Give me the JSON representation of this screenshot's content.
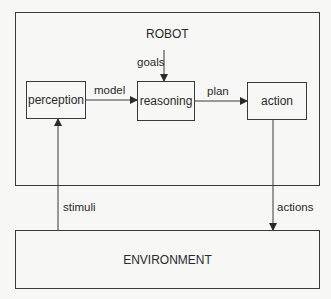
{
  "diagram": {
    "robot": {
      "label": "ROBOT"
    },
    "environment": {
      "label": "ENVIRONMENT"
    },
    "nodes": [
      {
        "id": "perception",
        "label": "perception"
      },
      {
        "id": "reasoning",
        "label": "reasoning"
      },
      {
        "id": "action",
        "label": "action"
      }
    ],
    "edges": [
      {
        "from": "goals-input",
        "to": "reasoning",
        "label": "goals"
      },
      {
        "from": "perception",
        "to": "reasoning",
        "label": "model"
      },
      {
        "from": "reasoning",
        "to": "action",
        "label": "plan"
      },
      {
        "from": "environment",
        "to": "perception",
        "label": "stimuli"
      },
      {
        "from": "action",
        "to": "environment",
        "label": "actions"
      }
    ]
  }
}
